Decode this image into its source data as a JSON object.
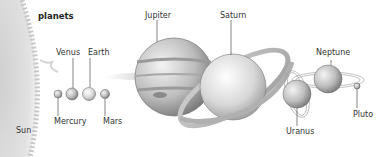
{
  "title": "planets",
  "sun": {
    "label": "Sun"
  },
  "planets": [
    {
      "name": "Mercury",
      "label": "Mercury"
    },
    {
      "name": "Venus",
      "label": "Venus"
    },
    {
      "name": "Earth",
      "label": "Earth"
    },
    {
      "name": "Mars",
      "label": "Mars"
    },
    {
      "name": "Jupiter",
      "label": "Jupiter"
    },
    {
      "name": "Saturn",
      "label": "Saturn"
    },
    {
      "name": "Uranus",
      "label": "Uranus"
    },
    {
      "name": "Neptune",
      "label": "Neptune"
    },
    {
      "name": "Pluto",
      "label": "Pluto"
    }
  ],
  "colors": {
    "ink": "#333333",
    "planet_light": "#e8e8e8",
    "planet_dark": "#8a8a8a"
  }
}
